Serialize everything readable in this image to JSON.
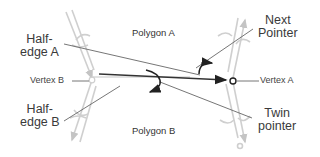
{
  "diagram": {
    "labels": {
      "polygon_a": "Polygon A",
      "polygon_b": "Polygon B",
      "vertex_a": "Vertex A",
      "vertex_b": "Vertex B",
      "half_edge_a_line1": "Half-",
      "half_edge_a_line2": "edge A",
      "half_edge_b_line1": "Half-",
      "half_edge_b_line2": "edge B",
      "next_pointer_line1": "Next",
      "next_pointer_line2": "Pointer",
      "twin_pointer_line1": "Twin",
      "twin_pointer_line2": "pointer"
    },
    "colors": {
      "main_edge": "#333333",
      "faint_edges": "#c8c8c8",
      "leader_lines": "#555555",
      "text": "#3a3a3a"
    }
  }
}
